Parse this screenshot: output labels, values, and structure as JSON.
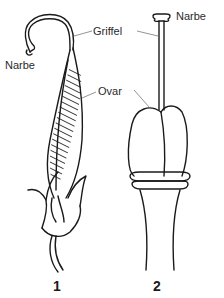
{
  "figure": {
    "panels": [
      {
        "number": "1",
        "labels": {
          "stigma": "Narbe",
          "style": "Griffel",
          "ovary": "Ovar"
        }
      },
      {
        "number": "2",
        "labels": {
          "stigma": "Narbe"
        }
      }
    ],
    "colors": {
      "line": "#1a1a1a",
      "leader": "#666666",
      "background": "#ffffff"
    }
  }
}
